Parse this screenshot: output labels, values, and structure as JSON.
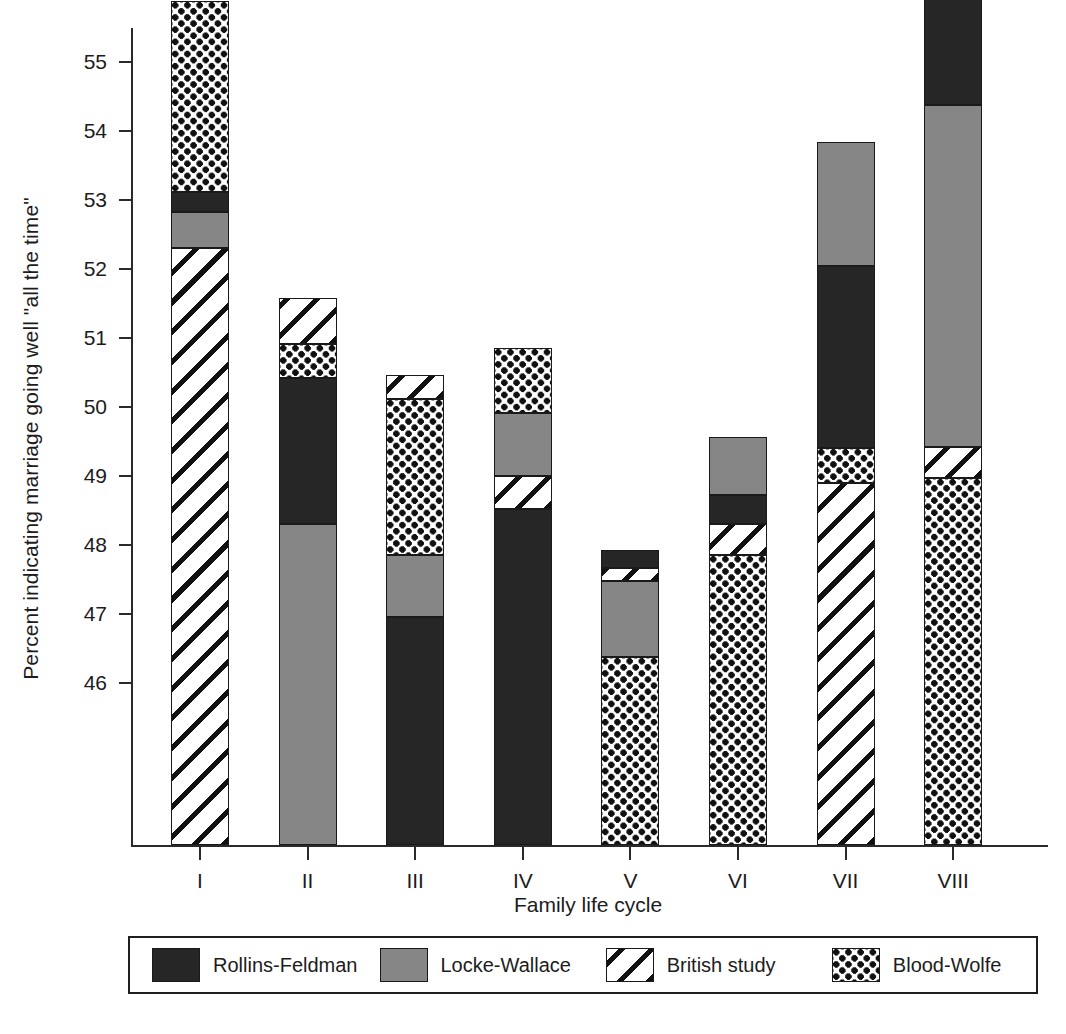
{
  "chart_data": {
    "type": "bar",
    "subtype": "stacked",
    "title": "",
    "xlabel": "Family life cycle",
    "ylabel": "Percent indicating marriage going well \"all the time\"",
    "categories": [
      "I",
      "II",
      "III",
      "IV",
      "V",
      "VI",
      "VII",
      "VIII"
    ],
    "ylim": [
      43.65,
      56.6
    ],
    "yticks": [
      46,
      47,
      48,
      49,
      50,
      51,
      52,
      53,
      54,
      55,
      56
    ],
    "ytick_labels": [
      "46",
      "47",
      "48",
      "49",
      "50",
      "51",
      "52",
      "53",
      "54",
      "55",
      "56"
    ],
    "grid": false,
    "legend_position": "bottom",
    "stack_note": "Segment values are cumulative tops read off the y-axis; each study contributes one segment per bar, ordered bottom-to-top as listed in 'stacks'.",
    "series": [
      {
        "name": "Rollins-Feldman",
        "fill": "black",
        "color": "#262626",
        "values": [
          0.29,
          2.12,
          1.63,
          4.85,
          0.26,
          0.42,
          2.64,
          2.0
        ]
      },
      {
        "name": "Locke-Wallace",
        "fill": "gray",
        "color": "#868686",
        "values": [
          0.53,
          4.65,
          0.95,
          0.92,
          1.1,
          0.85,
          1.8,
          4.96
        ]
      },
      {
        "name": "British study",
        "fill": "hatch",
        "color": "#ffffff",
        "values": [
          8.65,
          0.66,
          0.35,
          0.5,
          0.19,
          0.45,
          5.25,
          0.45
        ]
      },
      {
        "name": "Blood-Wolfe",
        "fill": "dots",
        "color": "#ffffff",
        "values": [
          2.76,
          0.49,
          2.27,
          0.93,
          2.73,
          4.2,
          0.5,
          5.32
        ]
      }
    ],
    "bar_tops": [
      55.88,
      51.58,
      50.47,
      50.85,
      47.93,
      49.57,
      53.84,
      56.38
    ],
    "stacks": [
      {
        "category": "I",
        "segments": [
          {
            "series": "British study",
            "fill": "hatch",
            "from": 43.65,
            "to": 52.3
          },
          {
            "series": "Locke-Wallace",
            "fill": "gray",
            "from": 52.3,
            "to": 52.83
          },
          {
            "series": "Rollins-Feldman",
            "fill": "black",
            "from": 52.83,
            "to": 53.12
          },
          {
            "series": "Blood-Wolfe",
            "fill": "dots",
            "from": 53.12,
            "to": 55.88
          }
        ]
      },
      {
        "category": "II",
        "segments": [
          {
            "series": "Locke-Wallace",
            "fill": "gray",
            "from": 43.65,
            "to": 48.3
          },
          {
            "series": "Rollins-Feldman",
            "fill": "black",
            "from": 48.3,
            "to": 50.42
          },
          {
            "series": "Blood-Wolfe",
            "fill": "dots",
            "from": 50.42,
            "to": 50.91
          },
          {
            "series": "British study",
            "fill": "hatch",
            "from": 50.91,
            "to": 51.58
          }
        ]
      },
      {
        "category": "III",
        "segments": [
          {
            "series": "Rollins-Feldman",
            "fill": "black",
            "from": 43.65,
            "to": 46.95
          },
          {
            "series": "Locke-Wallace",
            "fill": "gray",
            "from": 46.95,
            "to": 47.85
          },
          {
            "series": "Blood-Wolfe",
            "fill": "dots",
            "from": 47.85,
            "to": 50.12
          },
          {
            "series": "British study",
            "fill": "hatch",
            "from": 50.12,
            "to": 50.47
          }
        ]
      },
      {
        "category": "IV",
        "segments": [
          {
            "series": "Rollins-Feldman",
            "fill": "black",
            "from": 43.65,
            "to": 48.52
          },
          {
            "series": "British study",
            "fill": "hatch",
            "from": 48.52,
            "to": 49.0
          },
          {
            "series": "Locke-Wallace",
            "fill": "gray",
            "from": 49.0,
            "to": 49.92
          },
          {
            "series": "Blood-Wolfe",
            "fill": "dots",
            "from": 49.92,
            "to": 50.85
          }
        ]
      },
      {
        "category": "V",
        "segments": [
          {
            "series": "Blood-Wolfe",
            "fill": "dots",
            "from": 43.65,
            "to": 46.38
          },
          {
            "series": "Locke-Wallace",
            "fill": "gray",
            "from": 46.38,
            "to": 47.48
          },
          {
            "series": "British study",
            "fill": "hatch",
            "from": 47.48,
            "to": 47.67
          },
          {
            "series": "Rollins-Feldman",
            "fill": "black",
            "from": 47.67,
            "to": 47.93
          }
        ]
      },
      {
        "category": "VI",
        "segments": [
          {
            "series": "Blood-Wolfe",
            "fill": "dots",
            "from": 43.65,
            "to": 47.85
          },
          {
            "series": "British study",
            "fill": "hatch",
            "from": 47.85,
            "to": 48.3
          },
          {
            "series": "Rollins-Feldman",
            "fill": "black",
            "from": 48.3,
            "to": 48.72
          },
          {
            "series": "Locke-Wallace",
            "fill": "gray",
            "from": 48.72,
            "to": 49.57
          }
        ]
      },
      {
        "category": "VII",
        "segments": [
          {
            "series": "British study",
            "fill": "hatch",
            "from": 43.65,
            "to": 48.9
          },
          {
            "series": "Blood-Wolfe",
            "fill": "dots",
            "from": 48.9,
            "to": 49.4
          },
          {
            "series": "Rollins-Feldman",
            "fill": "black",
            "from": 49.4,
            "to": 52.04
          },
          {
            "series": "Locke-Wallace",
            "fill": "gray",
            "from": 52.04,
            "to": 53.84
          }
        ]
      },
      {
        "category": "VIII",
        "segments": [
          {
            "series": "Blood-Wolfe",
            "fill": "dots",
            "from": 43.65,
            "to": 48.97
          },
          {
            "series": "British study",
            "fill": "hatch",
            "from": 48.97,
            "to": 49.42
          },
          {
            "series": "Locke-Wallace",
            "fill": "gray",
            "from": 49.42,
            "to": 54.38
          },
          {
            "series": "Rollins-Feldman",
            "fill": "black",
            "from": 54.38,
            "to": 56.38
          }
        ]
      }
    ],
    "legend": [
      {
        "label": "Rollins-Feldman",
        "fill": "black"
      },
      {
        "label": "Locke-Wallace",
        "fill": "gray"
      },
      {
        "label": "British study",
        "fill": "hatch"
      },
      {
        "label": "Blood-Wolfe",
        "fill": "dots"
      }
    ]
  }
}
